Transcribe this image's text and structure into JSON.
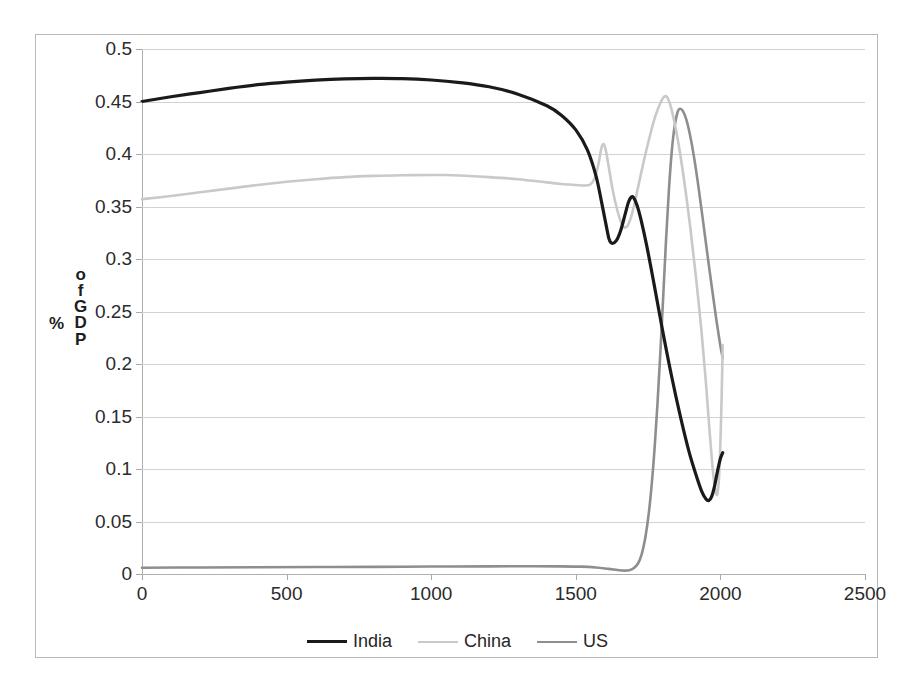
{
  "chart_data": {
    "type": "line",
    "title": "",
    "xlabel": "",
    "ylabel": "% of GDP",
    "xlim": [
      0,
      2500
    ],
    "ylim": [
      0,
      0.5
    ],
    "grid": true,
    "legend_position": "bottom",
    "x_ticks": [
      "0",
      "500",
      "1000",
      "1500",
      "2000",
      "2500"
    ],
    "y_ticks": [
      "0",
      "0.05",
      "0.1",
      "0.15",
      "0.2",
      "0.25",
      "0.3",
      "0.35",
      "0.4",
      "0.45",
      "0.5"
    ],
    "series": [
      {
        "name": "India",
        "color": "#1a1a1a",
        "width": 3.2,
        "points": [
          [
            0,
            0.45
          ],
          [
            100,
            0.4545
          ],
          [
            200,
            0.4585
          ],
          [
            300,
            0.4625
          ],
          [
            400,
            0.466
          ],
          [
            500,
            0.4685
          ],
          [
            600,
            0.4703
          ],
          [
            700,
            0.4715
          ],
          [
            800,
            0.472
          ],
          [
            900,
            0.4718
          ],
          [
            1000,
            0.4705
          ],
          [
            1100,
            0.468
          ],
          [
            1200,
            0.464
          ],
          [
            1300,
            0.457
          ],
          [
            1400,
            0.446
          ],
          [
            1450,
            0.437
          ],
          [
            1500,
            0.423
          ],
          [
            1540,
            0.404
          ],
          [
            1570,
            0.379
          ],
          [
            1590,
            0.353
          ],
          [
            1605,
            0.332
          ],
          [
            1615,
            0.319
          ],
          [
            1625,
            0.315
          ],
          [
            1640,
            0.3175
          ],
          [
            1655,
            0.327
          ],
          [
            1670,
            0.342
          ],
          [
            1682,
            0.354
          ],
          [
            1692,
            0.359
          ],
          [
            1700,
            0.3585
          ],
          [
            1712,
            0.351
          ],
          [
            1725,
            0.338
          ],
          [
            1745,
            0.313
          ],
          [
            1770,
            0.277
          ],
          [
            1800,
            0.232
          ],
          [
            1830,
            0.19
          ],
          [
            1860,
            0.152
          ],
          [
            1890,
            0.118
          ],
          [
            1915,
            0.095
          ],
          [
            1935,
            0.079
          ],
          [
            1950,
            0.0715
          ],
          [
            1960,
            0.07
          ],
          [
            1970,
            0.074
          ],
          [
            1980,
            0.084
          ],
          [
            1990,
            0.098
          ],
          [
            2000,
            0.11
          ],
          [
            2008,
            0.1155
          ]
        ]
      },
      {
        "name": "China",
        "color": "#c9c9c9",
        "width": 2.6,
        "points": [
          [
            0,
            0.357
          ],
          [
            100,
            0.36
          ],
          [
            200,
            0.3635
          ],
          [
            300,
            0.367
          ],
          [
            400,
            0.3705
          ],
          [
            500,
            0.3735
          ],
          [
            600,
            0.376
          ],
          [
            700,
            0.378
          ],
          [
            800,
            0.3792
          ],
          [
            900,
            0.3798
          ],
          [
            1000,
            0.38
          ],
          [
            1050,
            0.38
          ],
          [
            1100,
            0.3795
          ],
          [
            1200,
            0.378
          ],
          [
            1300,
            0.376
          ],
          [
            1400,
            0.373
          ],
          [
            1450,
            0.3715
          ],
          [
            1500,
            0.3705
          ],
          [
            1530,
            0.37
          ],
          [
            1550,
            0.371
          ],
          [
            1565,
            0.377
          ],
          [
            1578,
            0.39
          ],
          [
            1588,
            0.405
          ],
          [
            1596,
            0.4095
          ],
          [
            1604,
            0.403
          ],
          [
            1615,
            0.386
          ],
          [
            1628,
            0.365
          ],
          [
            1645,
            0.345
          ],
          [
            1660,
            0.333
          ],
          [
            1672,
            0.33
          ],
          [
            1685,
            0.335
          ],
          [
            1700,
            0.349
          ],
          [
            1715,
            0.368
          ],
          [
            1735,
            0.393
          ],
          [
            1755,
            0.416
          ],
          [
            1775,
            0.436
          ],
          [
            1795,
            0.45
          ],
          [
            1808,
            0.455
          ],
          [
            1820,
            0.452
          ],
          [
            1835,
            0.438
          ],
          [
            1855,
            0.41
          ],
          [
            1875,
            0.374
          ],
          [
            1895,
            0.332
          ],
          [
            1915,
            0.284
          ],
          [
            1935,
            0.23
          ],
          [
            1950,
            0.182
          ],
          [
            1962,
            0.138
          ],
          [
            1972,
            0.104
          ],
          [
            1980,
            0.084
          ],
          [
            1986,
            0.076
          ],
          [
            1990,
            0.077
          ],
          [
            1995,
            0.09
          ],
          [
            2000,
            0.125
          ],
          [
            2004,
            0.165
          ],
          [
            2008,
            0.218
          ]
        ]
      },
      {
        "name": "US",
        "color": "#8e8e8e",
        "width": 2.6,
        "points": [
          [
            0,
            0.006
          ],
          [
            200,
            0.0062
          ],
          [
            400,
            0.0064
          ],
          [
            600,
            0.0066
          ],
          [
            800,
            0.0068
          ],
          [
            1000,
            0.0071
          ],
          [
            1200,
            0.0073
          ],
          [
            1350,
            0.0074
          ],
          [
            1450,
            0.0073
          ],
          [
            1520,
            0.007
          ],
          [
            1570,
            0.0062
          ],
          [
            1610,
            0.005
          ],
          [
            1645,
            0.0038
          ],
          [
            1668,
            0.0032
          ],
          [
            1685,
            0.0036
          ],
          [
            1700,
            0.0055
          ],
          [
            1715,
            0.01
          ],
          [
            1728,
            0.019
          ],
          [
            1740,
            0.034
          ],
          [
            1752,
            0.057
          ],
          [
            1762,
            0.084
          ],
          [
            1772,
            0.118
          ],
          [
            1782,
            0.16
          ],
          [
            1792,
            0.209
          ],
          [
            1802,
            0.263
          ],
          [
            1812,
            0.318
          ],
          [
            1822,
            0.366
          ],
          [
            1832,
            0.403
          ],
          [
            1842,
            0.427
          ],
          [
            1852,
            0.44
          ],
          [
            1860,
            0.443
          ],
          [
            1870,
            0.441
          ],
          [
            1882,
            0.433
          ],
          [
            1895,
            0.418
          ],
          [
            1910,
            0.395
          ],
          [
            1925,
            0.367
          ],
          [
            1940,
            0.336
          ],
          [
            1955,
            0.3045
          ],
          [
            1965,
            0.284
          ],
          [
            1975,
            0.264
          ],
          [
            1985,
            0.244
          ],
          [
            1995,
            0.226
          ],
          [
            2002,
            0.214
          ],
          [
            2008,
            0.206
          ]
        ]
      }
    ],
    "legend": [
      {
        "label": "India",
        "color": "#1a1a1a"
      },
      {
        "label": "China",
        "color": "#c9c9c9"
      },
      {
        "label": "US",
        "color": "#8e8e8e"
      }
    ]
  }
}
